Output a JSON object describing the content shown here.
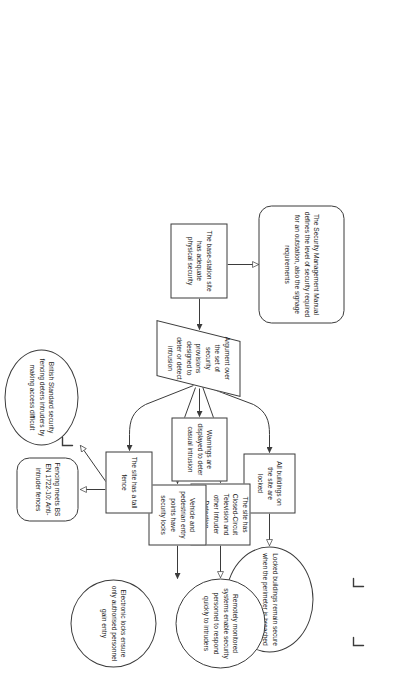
{
  "diagram": {
    "type": "assurance-case",
    "notation": "Goal Structuring Notation",
    "orientation": "rotated-90-clockwise",
    "background_color": "#ffffff",
    "stroke_color": "#3b3b3b",
    "text_color": "#1a1a1a",
    "nodes": [
      {
        "id": "G1",
        "kind": "goal",
        "shape": "rectangle",
        "text": "The base-station site has adequate physical security"
      },
      {
        "id": "C1",
        "kind": "context",
        "shape": "rounded-rectangle",
        "text": "The Security Management Manual defines the level of security required for an outstation, also the signage requirements"
      },
      {
        "id": "S1",
        "kind": "strategy",
        "shape": "parallelogram",
        "text": "Argument over the set of security provisions designed to deter or detect intrusion"
      },
      {
        "id": "G2",
        "kind": "goal",
        "shape": "rectangle",
        "text": "All buildings on the site are locked"
      },
      {
        "id": "G3",
        "kind": "goal",
        "shape": "rectangle",
        "text": "The site has Closed-Circuit Television and other Intruder Detection Systems"
      },
      {
        "id": "G4",
        "kind": "goal",
        "shape": "rectangle",
        "text": "Warnings are displayed to deter casual intrusion"
      },
      {
        "id": "G5",
        "kind": "goal",
        "shape": "rectangle",
        "text": "Vehicle and pedestrian entry points have security locks"
      },
      {
        "id": "G6",
        "kind": "goal",
        "shape": "rectangle",
        "text": "The site has a tall fence"
      },
      {
        "id": "Sn1",
        "kind": "solution",
        "shape": "ellipse",
        "text": "Locked buildings remain secure when the perimeter is breached"
      },
      {
        "id": "Sn2",
        "kind": "solution",
        "shape": "ellipse",
        "text": "Remotely monitored systems enable security personnel to respond quickly to intruders"
      },
      {
        "id": "Sn3",
        "kind": "solution",
        "shape": "ellipse",
        "text": "Electronic locks ensure only authorised personnel gain entry"
      },
      {
        "id": "Sn4",
        "kind": "solution",
        "shape": "ellipse",
        "text": "British Standard security fencing deters intruders by making access difficult"
      },
      {
        "id": "C2",
        "kind": "context",
        "shape": "rounded-rectangle",
        "text": "Fencing meets BS EN 1722-10: Anti-intruder fences"
      }
    ],
    "undeveloped_markers": [
      {
        "on": "Sn1"
      },
      {
        "on": "Sn2"
      },
      {
        "on": "Sn4"
      }
    ],
    "edges": [
      {
        "from": "G1",
        "to": "C1",
        "type": "in-context-of"
      },
      {
        "from": "G1",
        "to": "S1",
        "type": "supported-by"
      },
      {
        "from": "S1",
        "to": "G2",
        "type": "supported-by"
      },
      {
        "from": "S1",
        "to": "G3",
        "type": "supported-by"
      },
      {
        "from": "S1",
        "to": "G4",
        "type": "supported-by"
      },
      {
        "from": "S1",
        "to": "G5",
        "type": "supported-by"
      },
      {
        "from": "S1",
        "to": "G6",
        "type": "supported-by"
      },
      {
        "from": "G2",
        "to": "Sn1",
        "type": "in-context-of"
      },
      {
        "from": "G3",
        "to": "Sn2",
        "type": "in-context-of"
      },
      {
        "from": "G5",
        "to": "Sn3",
        "type": "supported-by"
      },
      {
        "from": "G6",
        "to": "Sn4",
        "type": "in-context-of"
      },
      {
        "from": "G6",
        "to": "C2",
        "type": "in-context-of"
      }
    ]
  }
}
